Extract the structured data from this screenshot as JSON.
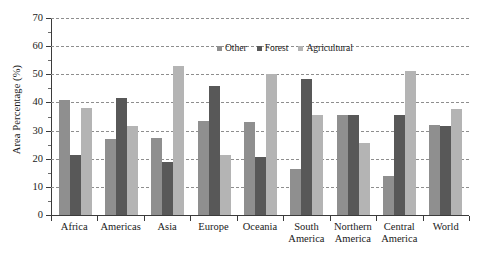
{
  "chart_data": {
    "type": "bar",
    "title": "",
    "xlabel": "",
    "ylabel": "Area Percentage (%)",
    "ylim": [
      0,
      70
    ],
    "ytick_step": 10,
    "yticks": [
      0,
      10,
      20,
      30,
      40,
      50,
      60,
      70
    ],
    "ytick_labels": [
      "0",
      "10",
      "20",
      "30",
      "40",
      "50",
      "60",
      "70"
    ],
    "grid": "horizontal-dashed",
    "legend_position": "top-center",
    "categories": [
      "Africa",
      "Americas",
      "Asia",
      "Europe",
      "Oceania",
      "South America",
      "Northern America",
      "Central America",
      "World"
    ],
    "category_lines": [
      [
        "Africa"
      ],
      [
        "Americas"
      ],
      [
        "Asia"
      ],
      [
        "Europe"
      ],
      [
        "Oceania"
      ],
      [
        "South",
        "America"
      ],
      [
        "Northern",
        "America"
      ],
      [
        "Central",
        "America"
      ],
      [
        "World"
      ]
    ],
    "series": [
      {
        "name": "Other",
        "color": "#8f8f8f",
        "values": [
          41,
          27,
          27.5,
          33.5,
          33,
          16.5,
          35.5,
          14,
          32
        ]
      },
      {
        "name": "Forest",
        "color": "#585858",
        "values": [
          21.5,
          41.5,
          19,
          46,
          20.5,
          48.5,
          35.5,
          35.5,
          31.5
        ]
      },
      {
        "name": "Agricultural",
        "color": "#b4b4b4",
        "values": [
          38,
          31.5,
          53,
          21.5,
          50,
          35.5,
          25.5,
          51,
          37.5
        ]
      }
    ]
  }
}
